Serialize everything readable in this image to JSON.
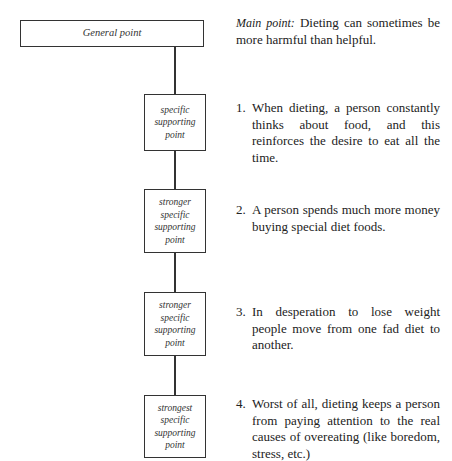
{
  "diagram": {
    "general_box": "General point",
    "boxes": [
      {
        "lines": [
          "specific",
          "supporting",
          "point"
        ]
      },
      {
        "lines": [
          "stronger",
          "specific",
          "supporting",
          "point"
        ]
      },
      {
        "lines": [
          "stronger",
          "specific",
          "supporting",
          "point"
        ]
      },
      {
        "lines": [
          "strongest",
          "specific",
          "supporting",
          "point"
        ]
      }
    ]
  },
  "text": {
    "main_label": "Main point:",
    "main_body": " Dieting can sometimes be more harmful than helpful.",
    "items": [
      {
        "num": "1.",
        "body": "When dieting, a person constantly thinks about food, and this reinforces the desire to eat all the time."
      },
      {
        "num": "2.",
        "body": "A person spends much more money buying special diet foods."
      },
      {
        "num": "3.",
        "body": "In desperation to lose weight people move from one fad diet to another."
      },
      {
        "num": "4.",
        "body": "Worst of all, dieting keeps a person from paying attention to the real causes of overeating (like boredom, stress, etc.)"
      }
    ]
  }
}
